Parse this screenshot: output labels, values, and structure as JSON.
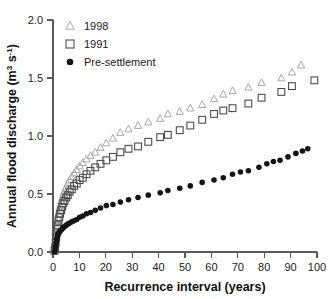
{
  "chart_data": {
    "type": "scatter",
    "title": "",
    "xlabel": "Recurrence interval (years)",
    "ylabel": "Annual flood discharge (m³ s⁻¹)",
    "ylabel_parts": {
      "main": "Annual flood discharge (m",
      "sup1": "3",
      "mid": " s",
      "sup2": "-1",
      "tail": ")"
    },
    "xlim": [
      0,
      100
    ],
    "ylim": [
      0.0,
      2.0
    ],
    "xticks": [
      0,
      10,
      20,
      30,
      40,
      50,
      60,
      70,
      80,
      90,
      100
    ],
    "xtick_labels": [
      "0",
      "10",
      "20",
      "30",
      "40",
      "50",
      "60",
      "70",
      "80",
      "90",
      "100"
    ],
    "yticks": [
      0.0,
      0.5,
      1.0,
      1.5,
      2.0
    ],
    "ytick_labels": [
      "0.0",
      "0.5",
      "1.0",
      "1.5",
      "2.0"
    ],
    "grid": false,
    "legend_position": "top-left-inside",
    "series": [
      {
        "name": "1998",
        "marker": "triangle-open",
        "color": "#a8a8a8",
        "points": [
          [
            0.6,
            0.02
          ],
          [
            0.8,
            0.06
          ],
          [
            1.0,
            0.1
          ],
          [
            1.2,
            0.15
          ],
          [
            1.4,
            0.2
          ],
          [
            1.6,
            0.25
          ],
          [
            1.8,
            0.29
          ],
          [
            2.1,
            0.33
          ],
          [
            2.4,
            0.37
          ],
          [
            2.7,
            0.4
          ],
          [
            3.1,
            0.44
          ],
          [
            3.5,
            0.47
          ],
          [
            3.9,
            0.5
          ],
          [
            4.4,
            0.53
          ],
          [
            5.0,
            0.56
          ],
          [
            5.6,
            0.59
          ],
          [
            6.3,
            0.62
          ],
          [
            7.1,
            0.65
          ],
          [
            8.0,
            0.68
          ],
          [
            9.0,
            0.71
          ],
          [
            10.1,
            0.74
          ],
          [
            11.3,
            0.77
          ],
          [
            12.7,
            0.8
          ],
          [
            14.2,
            0.83
          ],
          [
            16.0,
            0.86
          ],
          [
            18.0,
            0.9
          ],
          [
            20.2,
            0.94
          ],
          [
            22.7,
            0.98
          ],
          [
            25.5,
            1.03
          ],
          [
            28.6,
            1.06
          ],
          [
            32.2,
            1.09
          ],
          [
            36.1,
            1.12
          ],
          [
            40.6,
            1.15
          ],
          [
            43.5,
            1.19
          ],
          [
            48.0,
            1.21
          ],
          [
            52.0,
            1.24
          ],
          [
            56.5,
            1.27
          ],
          [
            61.0,
            1.32
          ],
          [
            64.5,
            1.36
          ],
          [
            68.0,
            1.39
          ],
          [
            74.0,
            1.42
          ],
          [
            79.0,
            1.46
          ],
          [
            86.5,
            1.5
          ],
          [
            90.5,
            1.55
          ],
          [
            94.0,
            1.61
          ]
        ]
      },
      {
        "name": "1991",
        "marker": "square-open",
        "color": "#4d4d4d",
        "points": [
          [
            0.6,
            0.01
          ],
          [
            0.8,
            0.04
          ],
          [
            1.0,
            0.08
          ],
          [
            1.2,
            0.12
          ],
          [
            1.4,
            0.16
          ],
          [
            1.6,
            0.2
          ],
          [
            1.8,
            0.23
          ],
          [
            2.1,
            0.27
          ],
          [
            2.4,
            0.3
          ],
          [
            2.7,
            0.33
          ],
          [
            3.1,
            0.36
          ],
          [
            3.5,
            0.39
          ],
          [
            3.9,
            0.42
          ],
          [
            4.4,
            0.44
          ],
          [
            5.0,
            0.47
          ],
          [
            5.6,
            0.49
          ],
          [
            6.3,
            0.52
          ],
          [
            7.1,
            0.54
          ],
          [
            8.0,
            0.57
          ],
          [
            9.0,
            0.59
          ],
          [
            10.1,
            0.62
          ],
          [
            11.3,
            0.64
          ],
          [
            12.7,
            0.67
          ],
          [
            14.2,
            0.7
          ],
          [
            16.0,
            0.73
          ],
          [
            18.0,
            0.76
          ],
          [
            20.2,
            0.79
          ],
          [
            22.7,
            0.82
          ],
          [
            25.5,
            0.86
          ],
          [
            28.6,
            0.89
          ],
          [
            32.2,
            0.91
          ],
          [
            36.1,
            0.95
          ],
          [
            40.6,
            0.99
          ],
          [
            43.5,
            1.01
          ],
          [
            48.0,
            1.05
          ],
          [
            52.0,
            1.09
          ],
          [
            56.5,
            1.14
          ],
          [
            61.0,
            1.19
          ],
          [
            64.5,
            1.22
          ],
          [
            68.0,
            1.24
          ],
          [
            74.0,
            1.28
          ],
          [
            79.0,
            1.33
          ],
          [
            86.5,
            1.38
          ],
          [
            90.5,
            1.43
          ],
          [
            99.0,
            1.48
          ]
        ]
      },
      {
        "name": "Pre-settlement",
        "marker": "circle-filled",
        "color": "#141414",
        "points": [
          [
            0.6,
            0.0
          ],
          [
            0.8,
            0.02
          ],
          [
            1.0,
            0.05
          ],
          [
            1.2,
            0.08
          ],
          [
            1.4,
            0.11
          ],
          [
            1.6,
            0.13
          ],
          [
            1.8,
            0.15
          ],
          [
            2.1,
            0.16
          ],
          [
            2.4,
            0.17
          ],
          [
            2.7,
            0.18
          ],
          [
            3.1,
            0.19
          ],
          [
            3.5,
            0.2
          ],
          [
            3.9,
            0.21
          ],
          [
            4.4,
            0.22
          ],
          [
            5.0,
            0.23
          ],
          [
            5.6,
            0.24
          ],
          [
            6.3,
            0.25
          ],
          [
            7.1,
            0.26
          ],
          [
            8.0,
            0.27
          ],
          [
            9.0,
            0.28
          ],
          [
            10.1,
            0.3
          ],
          [
            11.3,
            0.31
          ],
          [
            12.7,
            0.33
          ],
          [
            14.2,
            0.34
          ],
          [
            16.0,
            0.36
          ],
          [
            18.0,
            0.38
          ],
          [
            20.2,
            0.4
          ],
          [
            22.7,
            0.41
          ],
          [
            25.5,
            0.43
          ],
          [
            28.6,
            0.45
          ],
          [
            32.2,
            0.47
          ],
          [
            36.1,
            0.49
          ],
          [
            40.6,
            0.51
          ],
          [
            43.5,
            0.53
          ],
          [
            48.0,
            0.55
          ],
          [
            52.0,
            0.57
          ],
          [
            56.5,
            0.6
          ],
          [
            61.0,
            0.62
          ],
          [
            64.5,
            0.64
          ],
          [
            68.0,
            0.67
          ],
          [
            71.0,
            0.69
          ],
          [
            74.0,
            0.7
          ],
          [
            78.0,
            0.73
          ],
          [
            81.0,
            0.76
          ],
          [
            83.5,
            0.78
          ],
          [
            86.0,
            0.79
          ],
          [
            89.0,
            0.82
          ],
          [
            92.0,
            0.85
          ],
          [
            94.5,
            0.87
          ],
          [
            96.5,
            0.89
          ]
        ]
      }
    ],
    "legend": [
      {
        "label": "1998",
        "marker": "triangle-open",
        "color": "#a8a8a8"
      },
      {
        "label": "1991",
        "marker": "square-open",
        "color": "#4d4d4d"
      },
      {
        "label": "Pre-settlement",
        "marker": "circle-filled",
        "color": "#141414"
      }
    ]
  }
}
